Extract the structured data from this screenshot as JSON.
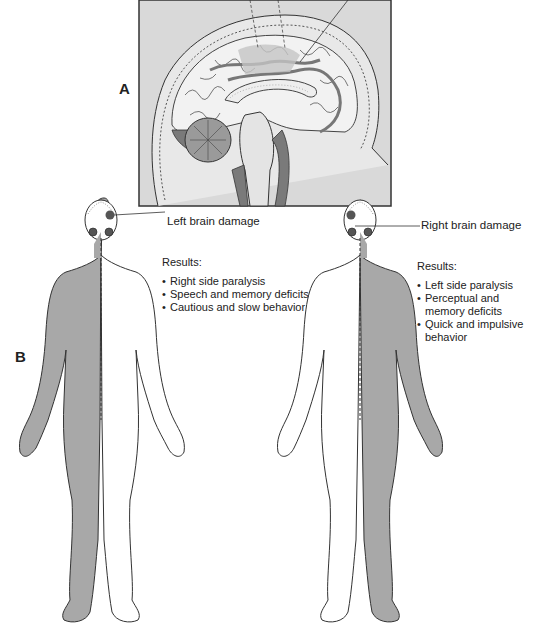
{
  "panels": {
    "a": {
      "label": "A",
      "description": "Sagittal section of the brain"
    },
    "b": {
      "label": "B"
    }
  },
  "left_figure": {
    "callout": "Left brain damage",
    "results_heading": "Results:",
    "results": [
      "Right side paralysis",
      "Speech and memory deficits",
      "Cautious and slow behavior"
    ],
    "affected_side": "right"
  },
  "right_figure": {
    "callout": "Right brain damage",
    "results_heading": "Results:",
    "results": [
      "Left side paralysis",
      "Perceptual and memory deficits",
      "Quick and impulsive behavior"
    ],
    "affected_side": "left"
  },
  "colors": {
    "shaded_body": "#a8a8a8",
    "frame_bg": "#d9d9d9",
    "outline": "#333333",
    "dark_tissue": "#7a7a7a"
  }
}
